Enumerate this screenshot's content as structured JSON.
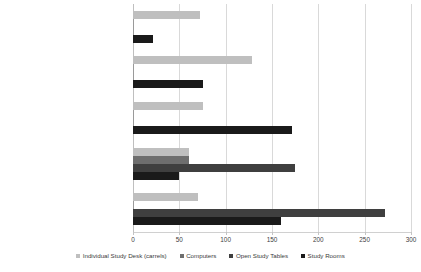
{
  "chart_data": {
    "type": "bar",
    "orientation": "horizontal",
    "title": "",
    "xlabel": "",
    "ylabel": "",
    "xlim": [
      0,
      300
    ],
    "xticks": [
      0,
      50,
      100,
      150,
      200,
      250,
      300
    ],
    "grid": true,
    "legend_position": "bottom",
    "categories": [
      "1st Floor (Collaboration Commons)",
      "2nd Floor (The floor you walk in on)",
      "3rd Floor (Group study)",
      "4th Floor (Quiet study)",
      "5th Floor (Silent study/grad student carrels)"
    ],
    "series": [
      {
        "name": "Individual Study Desk (carrels)",
        "color": "#bfbfbf",
        "values": [
          70,
          60,
          75,
          128,
          72
        ]
      },
      {
        "name": "Computers",
        "color": "#6e6e6e",
        "values": [
          0,
          60,
          0,
          0,
          0
        ]
      },
      {
        "name": "Open Study Tables",
        "color": "#3f3f3f",
        "values": [
          272,
          175,
          0,
          0,
          0
        ]
      },
      {
        "name": "Study Rooms",
        "color": "#1a1a1a",
        "values": [
          160,
          50,
          172,
          75,
          22
        ]
      }
    ]
  }
}
